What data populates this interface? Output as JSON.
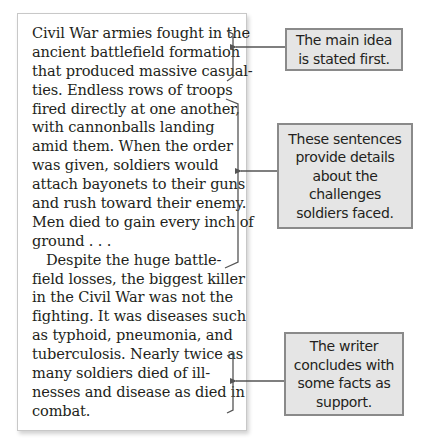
{
  "passage": {
    "lines": [
      "Civil War armies fought in the",
      "ancient battlefield formation",
      "that produced massive casual-",
      "ties. Endless rows of troops",
      "fired directly at one another,",
      "with cannonballs landing",
      "amid them. When the order",
      "was given, soldiers would",
      "attach bayonets to their guns",
      "and rush toward their enemy.",
      "Men died to gain every inch of",
      "ground . . .",
      "Despite the huge battle-",
      "field losses, the biggest killer",
      "in the Civil War was not the",
      "fighting. It was diseases such",
      "as typhoid, pneumonia, and",
      "tuberculosis. Nearly twice as",
      "many soldiers died of ill-",
      "nesses and disease as died in",
      "combat."
    ]
  },
  "callouts": [
    {
      "lines": [
        "The main idea",
        "is stated first."
      ]
    },
    {
      "lines": [
        "These sentences",
        "provide details",
        "about the",
        "challenges",
        "soldiers faced."
      ]
    },
    {
      "lines": [
        "The writer",
        "concludes with",
        "some facts as",
        "support."
      ]
    }
  ],
  "colors": {
    "callout_fill": "#e5e5e5",
    "callout_border": "#8a8a8a",
    "bracket": "#555555",
    "text": "#231f20"
  }
}
